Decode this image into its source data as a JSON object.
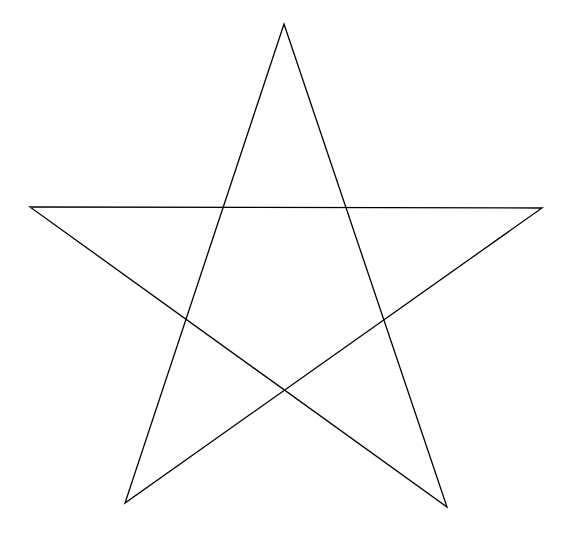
{
  "diagram": {
    "shape": "pentagram",
    "background": "#ffffff",
    "stroke_color": "#000000",
    "stroke_width": 1.3,
    "vertices": [
      {
        "name": "top",
        "x": 284,
        "y": 24
      },
      {
        "name": "bottom-right",
        "x": 447,
        "y": 507
      },
      {
        "name": "left",
        "x": 30,
        "y": 207
      },
      {
        "name": "right",
        "x": 542,
        "y": 208
      },
      {
        "name": "bottom-left",
        "x": 125,
        "y": 503
      }
    ]
  }
}
